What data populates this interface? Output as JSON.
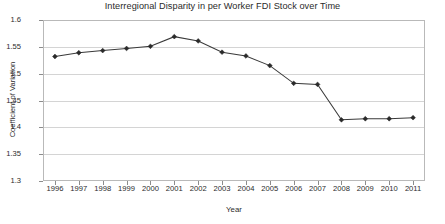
{
  "chart_data": {
    "type": "line",
    "title": "Interregional Disparity in per Worker FDI Stock over Time",
    "xlabel": "Year",
    "ylabel": "Coefficient of Variation",
    "categories": [
      1996,
      1997,
      1998,
      1999,
      2000,
      2001,
      2002,
      2003,
      2004,
      2005,
      2006,
      2007,
      2008,
      2009,
      2010,
      2011
    ],
    "x_tick_labels": [
      "1996",
      "1997",
      "1998",
      "1999",
      "2000",
      "2001",
      "2002",
      "2003",
      "2004",
      "2005",
      "2006",
      "2007",
      "2008",
      "2009",
      "2010",
      "2011"
    ],
    "values": [
      1.532,
      1.539,
      1.543,
      1.547,
      1.551,
      1.569,
      1.561,
      1.54,
      1.533,
      1.515,
      1.482,
      1.48,
      1.414,
      1.416,
      1.416,
      1.418
    ],
    "ylim": [
      1.3,
      1.6
    ],
    "y_ticks": [
      1.3,
      1.35,
      1.4,
      1.45,
      1.5,
      1.55,
      1.6
    ],
    "y_tick_labels": [
      "1.3",
      "1.35",
      "1.4",
      "1.45",
      "1.5",
      "1.55",
      "1.6"
    ],
    "grid": true,
    "legend": false,
    "series_color": "#3a3a3a",
    "marker": "diamond",
    "marker_color": "#2a2a2a",
    "grid_color": "#d4d4d4",
    "frame_color": "#b9b9b9"
  }
}
